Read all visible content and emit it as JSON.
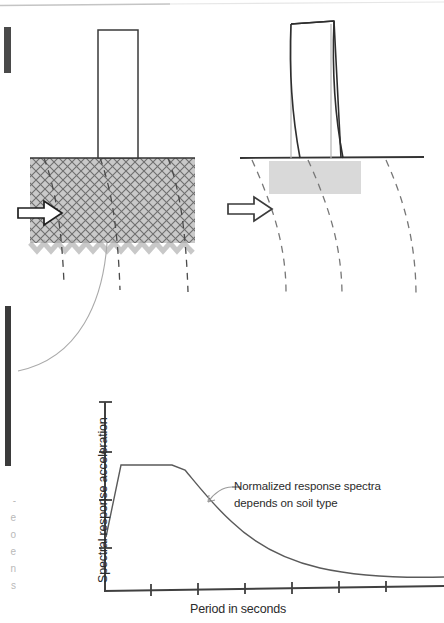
{
  "figure": {
    "top_rule": {
      "name": "page-top-rule",
      "color": "#b0b0b0"
    },
    "left_marks": [
      {
        "name": "page-edge-mark-upper",
        "color": "#4a4a4a"
      },
      {
        "name": "page-edge-mark-lower",
        "color": "#3b3b3b"
      }
    ],
    "diagrams": [
      {
        "id": "soft-soil-diagram",
        "label": "",
        "building_state": "undeformed",
        "soil_fill": "cross-hatch",
        "arrow_label": "",
        "ground_hatch_color": "#8a8a8a"
      },
      {
        "id": "rock-site-diagram",
        "label": "",
        "building_state": "deformed",
        "soil_fill": "solid-light-gray",
        "arrow_label": "",
        "block_color": "#d9d9d9"
      }
    ]
  },
  "chart_annotation": {
    "line1": "Normalized response spectra",
    "line2": "depends on soil type"
  },
  "margin_text_fragments": [
    "-",
    "e",
    "o",
    "e",
    "n",
    "s"
  ],
  "chart_data": {
    "type": "line",
    "title": "",
    "xlabel": "Period in seconds",
    "ylabel": "Spectral response acceleration",
    "xlim": [
      0,
      7
    ],
    "ylim": [
      0,
      1.2
    ],
    "grid": false,
    "legend": null,
    "x_tick_count": 7,
    "y_tick_count": 4,
    "x_tick_labels": [
      "",
      "",
      "",
      "",
      "",
      "",
      ""
    ],
    "y_tick_labels": [
      "",
      "",
      "",
      ""
    ],
    "annotations": [
      {
        "text": "Normalized response spectra depends on soil type",
        "target_x": 2.0,
        "target_y": 0.52
      }
    ],
    "series": [
      {
        "name": "Normalized response spectra",
        "color": "#555555",
        "x": [
          0.0,
          0.12,
          0.55,
          1.3,
          1.6,
          1.9,
          2.25,
          2.65,
          3.1,
          3.6,
          4.2,
          4.9,
          5.7,
          6.6,
          7.0
        ],
        "y": [
          0.24,
          0.86,
          0.86,
          0.86,
          0.76,
          0.66,
          0.57,
          0.49,
          0.42,
          0.36,
          0.31,
          0.27,
          0.245,
          0.232,
          0.23
        ]
      }
    ]
  }
}
